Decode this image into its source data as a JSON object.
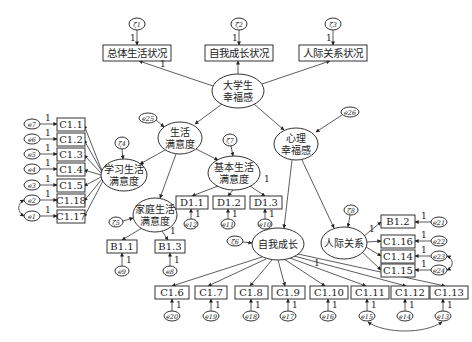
{
  "diagram": {
    "type": "structural-equation-model",
    "latent": [
      {
        "id": "L0",
        "label1": "大学生",
        "label2": "幸福感",
        "cx": 238,
        "cy": 91,
        "rx": 26,
        "ry": 17
      },
      {
        "id": "L1",
        "label1": "生活",
        "label2": "满意度",
        "cx": 180,
        "cy": 138,
        "rx": 22,
        "ry": 16
      },
      {
        "id": "L2",
        "label1": "心理",
        "label2": "幸福感",
        "cx": 296,
        "cy": 144,
        "rx": 22,
        "ry": 16
      },
      {
        "id": "L3",
        "label1": "学习生活",
        "label2": "满意度",
        "cx": 124,
        "cy": 175,
        "rx": 23,
        "ry": 16
      },
      {
        "id": "L4",
        "label1": "基本生活",
        "label2": "满意度",
        "cx": 234,
        "cy": 173,
        "rx": 26,
        "ry": 17
      },
      {
        "id": "L5",
        "label1": "家庭生活",
        "label2": "满意度",
        "cx": 155,
        "cy": 215,
        "rx": 22,
        "ry": 17
      },
      {
        "id": "L6",
        "label1": "自我成长",
        "label2": "",
        "cx": 278,
        "cy": 244,
        "rx": 26,
        "ry": 16
      },
      {
        "id": "L7",
        "label1": "人际关系",
        "label2": "",
        "cx": 344,
        "cy": 243,
        "rx": 23,
        "ry": 16
      }
    ],
    "top_indicators": [
      {
        "label": "总体生活状况",
        "x": 103,
        "y": 45,
        "w": 68,
        "h": 16,
        "zeta": "ζ1",
        "one": "1"
      },
      {
        "label": "自我成长状况",
        "x": 205,
        "y": 45,
        "w": 68,
        "h": 16,
        "zeta": "ζ2",
        "one": "1"
      },
      {
        "label": "人际关系状况",
        "x": 299,
        "y": 45,
        "w": 68,
        "h": 16,
        "zeta": "ζ3",
        "one": "1"
      }
    ],
    "top_path_label": "1",
    "study_items": [
      {
        "label": "C1.1",
        "err": "e7",
        "y": 125
      },
      {
        "label": "C1.2",
        "err": "e6",
        "y": 140
      },
      {
        "label": "C1.3",
        "err": "e5",
        "y": 155
      },
      {
        "label": "C1.4",
        "err": "e4",
        "y": 170
      },
      {
        "label": "C1.5",
        "err": "e3",
        "y": 186
      },
      {
        "label": "C1.18",
        "err": "e2",
        "y": 201
      },
      {
        "label": "C1.17",
        "err": "e1",
        "y": 217
      }
    ],
    "basic_items": [
      {
        "label": "D1.1",
        "err": "e12",
        "x": 190
      },
      {
        "label": "D1.2",
        "err": "e11",
        "x": 227
      },
      {
        "label": "D1.3",
        "err": "e10",
        "x": 263
      }
    ],
    "family_items": [
      {
        "label": "B1.1",
        "err": "e9",
        "x": 108
      },
      {
        "label": "B1.3",
        "err": "e8",
        "x": 155
      }
    ],
    "relation_items": [
      {
        "label": "B1.2",
        "err": "e21",
        "y": 222
      },
      {
        "label": "C1.16",
        "err": "e22",
        "y": 241
      },
      {
        "label": "C1.14",
        "err": "e23",
        "y": 256
      },
      {
        "label": "C1.15",
        "err": "e24",
        "y": 270
      }
    ],
    "growth_items": [
      {
        "label": "C1.6",
        "err": "e20",
        "x": 155
      },
      {
        "label": "C1.7",
        "err": "e19",
        "x": 195
      },
      {
        "label": "C1.8",
        "err": "e18",
        "x": 235
      },
      {
        "label": "C1.9",
        "err": "e17",
        "x": 272
      },
      {
        "label": "C1.10",
        "err": "e16",
        "x": 312
      },
      {
        "label": "C1.11",
        "err": "e15",
        "x": 353
      },
      {
        "label": "C1.12",
        "err": "e14",
        "x": 393
      },
      {
        "label": "C1.13",
        "err": "e13",
        "x": 432
      }
    ],
    "disturbances": {
      "life_satisfaction": "e25",
      "psych_wellbeing": "e26",
      "study": "ζ4",
      "basic": "ζ7",
      "family": "ζ5",
      "growth": "ζ6",
      "relation": "ζ8"
    },
    "fixed_loading": "1"
  }
}
